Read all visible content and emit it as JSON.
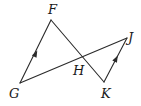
{
  "diagram": {
    "type": "geometry",
    "points": {
      "F": {
        "label": "F"
      },
      "G": {
        "label": "G"
      },
      "H": {
        "label": "H"
      },
      "J": {
        "label": "J"
      },
      "K": {
        "label": "K"
      }
    },
    "segments": [
      {
        "from": "G",
        "to": "F",
        "parallel_mark": true
      },
      {
        "from": "F",
        "to": "K",
        "parallel_mark": false
      },
      {
        "from": "G",
        "to": "J",
        "parallel_mark": false
      },
      {
        "from": "K",
        "to": "J",
        "parallel_mark": true
      }
    ],
    "color": "#2a2a2a"
  }
}
